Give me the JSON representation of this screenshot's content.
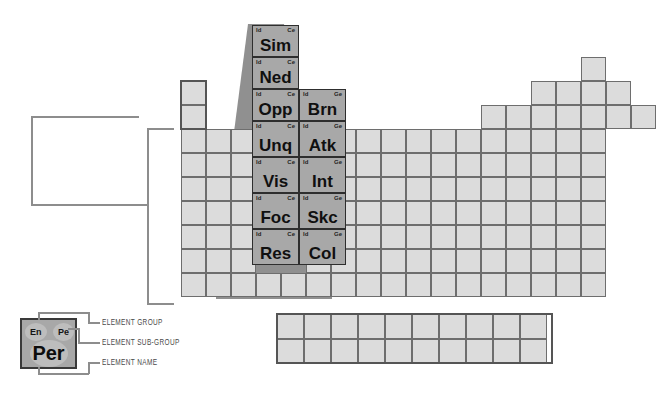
{
  "diagram": {
    "colors": {
      "cell_fill": "#d9d9d9",
      "cell_border": "#6e6e6e",
      "selected_fill": "#a8a8a8",
      "selected_border": "#2e2e2e",
      "shadow": "#8a8a8a",
      "outline": "#555555",
      "leader_line": "#8d8d8d",
      "text": "#141414",
      "label_text": "#4a4a4a"
    }
  },
  "corner_labels": {
    "group_left": "Id",
    "subgroup_right_ce": "Ce",
    "subgroup_right_ge": "Ge"
  },
  "selected_columns": {
    "left": [
      {
        "group": "Id",
        "subgroup": "Ce",
        "name": "Sim"
      },
      {
        "group": "Id",
        "subgroup": "Ce",
        "name": "Ned"
      },
      {
        "group": "Id",
        "subgroup": "Ce",
        "name": "Opp"
      },
      {
        "group": "Id",
        "subgroup": "Ce",
        "name": "Unq"
      },
      {
        "group": "Id",
        "subgroup": "Ce",
        "name": "Vis"
      },
      {
        "group": "Id",
        "subgroup": "Ce",
        "name": "Foc"
      },
      {
        "group": "Id",
        "subgroup": "Ce",
        "name": "Res"
      }
    ],
    "right": [
      {
        "group": "Id",
        "subgroup": "Ge",
        "name": "Brn"
      },
      {
        "group": "Id",
        "subgroup": "Ge",
        "name": "Atk"
      },
      {
        "group": "Id",
        "subgroup": "Ge",
        "name": "Int"
      },
      {
        "group": "Id",
        "subgroup": "Ge",
        "name": "Skc"
      },
      {
        "group": "Id",
        "subgroup": "Ge",
        "name": "Col"
      }
    ]
  },
  "legend": {
    "cell": {
      "group": "En",
      "subgroup": "Pe",
      "name": "Per"
    },
    "labels": {
      "group": "ELEMENT GROUP",
      "subgroup": "ELEMENT SUB-GROUP",
      "name": "ELEMENT NAME"
    }
  }
}
